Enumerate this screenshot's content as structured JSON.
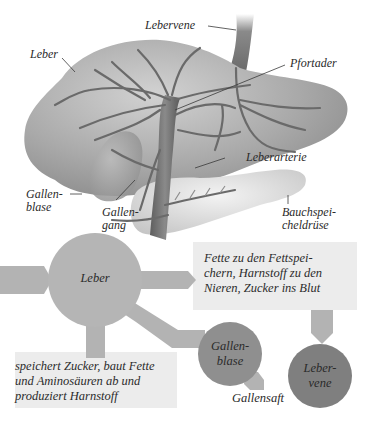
{
  "anatomy": {
    "labels": {
      "lebervene": "Lebervene",
      "leber": "Leber",
      "pfortader": "Pfortader",
      "leberarterie": "Leberarterie",
      "gallenblase_1": "Gallen-",
      "gallenblase_2": "blase",
      "gallengang_1": "Gallen-",
      "gallengang_2": "gang",
      "bauchspeicheldruese_1": "Bauchspei-",
      "bauchspeicheldruese_2": "cheldrüse"
    }
  },
  "flow": {
    "nodes": {
      "leber": "Leber",
      "gallenblase_1": "Gallen-",
      "gallenblase_2": "blase",
      "lebervene_1": "Leber-",
      "lebervene_2": "vene"
    },
    "box_outputs": {
      "line1": "Fette zu den Fettspei-",
      "line2": "chern, Harnstoff zu den",
      "line3": "Nieren, Zucker ins Blut"
    },
    "box_functions": {
      "line1": "speichert Zucker, baut Fette",
      "line2": "und Aminosäuren ab und",
      "line3": "produziert Harnstoff"
    },
    "gallensaft": "Gallensaft"
  },
  "colors": {
    "organ_gray": "#a8a8a8",
    "vessel_gray": "#6e6e6e",
    "leber_node": "#b5b5b5",
    "gallenblase_node": "#8f8f8f",
    "lebervene_node": "#7f7f7f",
    "arrow_gray": "#b3b3b3",
    "box_bg": "#ececec"
  }
}
